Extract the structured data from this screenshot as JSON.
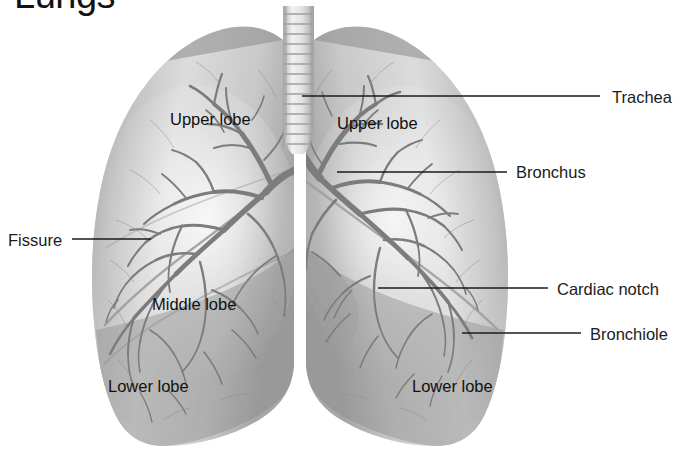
{
  "figure": {
    "title": "Lungs",
    "style": "grayscale-medical-illustration",
    "background_color": "#ffffff",
    "colors": {
      "lung_light": "#d8d8d8",
      "lung_mid": "#b8b8b8",
      "lung_shadow": "#8e8e8e",
      "bronchial_tree": "#7a7a7a",
      "trachea_light": "#e6e6e6",
      "trachea_ring": "#a9a9a9",
      "leader_line": "#1b1b1b",
      "label_text": "#1b1b1b"
    }
  },
  "internal_labels": [
    {
      "id": "upper-lobe-left",
      "text": "Upper lobe",
      "x": 170,
      "y": 110
    },
    {
      "id": "upper-lobe-right",
      "text": "Upper lobe",
      "x": 337,
      "y": 114
    },
    {
      "id": "middle-lobe",
      "text": "Middle lobe",
      "x": 152,
      "y": 295
    },
    {
      "id": "lower-lobe-left",
      "text": "Lower lobe",
      "x": 108,
      "y": 377
    },
    {
      "id": "lower-lobe-right",
      "text": "Lower lobe",
      "x": 412,
      "y": 377
    }
  ],
  "callouts": [
    {
      "id": "trachea",
      "text": "Trachea",
      "side": "right",
      "label_x": 612,
      "label_y": 88,
      "line": {
        "x1": 302,
        "y1": 96,
        "x2": 600,
        "y2": 96
      }
    },
    {
      "id": "bronchus",
      "text": "Bronchus",
      "side": "right",
      "label_x": 516,
      "label_y": 163,
      "line": {
        "x1": 337,
        "y1": 172,
        "x2": 507,
        "y2": 172
      }
    },
    {
      "id": "cardiac-notch",
      "text": "Cardiac notch",
      "side": "right",
      "label_x": 557,
      "label_y": 280,
      "line": {
        "x1": 378,
        "y1": 288,
        "x2": 548,
        "y2": 288
      }
    },
    {
      "id": "bronchiole",
      "text": "Bronchiole",
      "side": "right",
      "label_x": 590,
      "label_y": 325,
      "line": {
        "x1": 462,
        "y1": 333,
        "x2": 581,
        "y2": 333
      }
    },
    {
      "id": "fissure",
      "text": "Fissure",
      "side": "left",
      "label_x": 8,
      "label_y": 231,
      "line": {
        "x1": 72,
        "y1": 239,
        "x2": 151,
        "y2": 239
      }
    }
  ]
}
